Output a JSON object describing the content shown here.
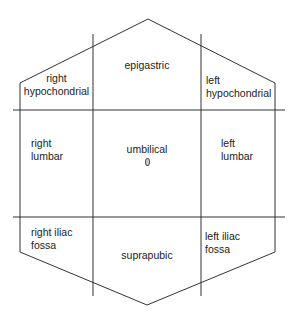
{
  "diagram": {
    "stroke_color": "#333333",
    "outline": {
      "shape": "hexagon",
      "points": [
        [
          148,
          19
        ],
        [
          275,
          83
        ],
        [
          275,
          252
        ],
        [
          147,
          305
        ],
        [
          20,
          252
        ],
        [
          20,
          83
        ]
      ]
    },
    "grid_lines": {
      "verticals": [
        {
          "name": "right-midclavicular-line",
          "x": 93,
          "y1": 34,
          "y2": 296
        },
        {
          "name": "left-midclavicular-line",
          "x": 201,
          "y1": 34,
          "y2": 296
        }
      ],
      "horizontals": [
        {
          "name": "upper-transverse-line",
          "y": 110,
          "x1": 13,
          "x2": 285
        },
        {
          "name": "lower-transverse-line",
          "y": 217,
          "x1": 13,
          "x2": 285
        }
      ]
    },
    "regions": {
      "right_hypochondrial": "right\nhypochondrial",
      "epigastric": "epigastric",
      "left_hypochondrial": "left\nhypochondrial",
      "right_lumbar": "right\nlumbar",
      "umbilical": "umbilical",
      "left_lumbar": "left\nlumbar",
      "right_iliac_fossa": "right iliac\nfossa",
      "suprapubic": "suprapubic",
      "left_iliac_fossa": "left iliac\nfossa"
    },
    "navel_marker": {
      "x": 147,
      "y": 160
    }
  }
}
